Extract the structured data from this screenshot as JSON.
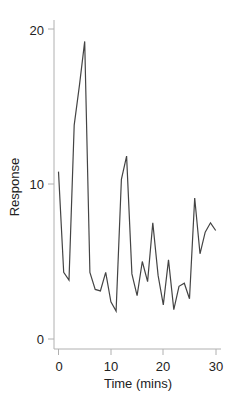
{
  "chart_data": {
    "type": "line",
    "title": "",
    "xlabel": "Time (mins)",
    "ylabel": "Response",
    "xlim": [
      -1,
      31
    ],
    "ylim": [
      -0.6,
      20.6
    ],
    "x_ticks": [
      0,
      10,
      20,
      30
    ],
    "y_ticks": [
      0,
      10,
      20
    ],
    "grid": false,
    "legend": null,
    "series": [
      {
        "name": "Response",
        "color": "#444444",
        "x": [
          0,
          1,
          2,
          3,
          4,
          5,
          6,
          7,
          8,
          9,
          10,
          11,
          12,
          13,
          14,
          15,
          16,
          17,
          18,
          19,
          20,
          21,
          22,
          23,
          24,
          25,
          26,
          27,
          28,
          29,
          30
        ],
        "values": [
          10.8,
          4.3,
          3.8,
          13.8,
          16.4,
          19.2,
          4.3,
          3.2,
          3.1,
          4.3,
          2.4,
          1.8,
          10.3,
          11.8,
          4.2,
          2.8,
          5.0,
          3.7,
          7.5,
          4.1,
          2.2,
          5.1,
          1.9,
          3.4,
          3.6,
          2.6,
          9.1,
          5.5,
          6.9,
          7.5,
          7.0
        ]
      }
    ]
  },
  "labels": {
    "x_ticks": [
      "0",
      "10",
      "20",
      "30"
    ],
    "y_ticks": [
      "0",
      "10",
      "20"
    ],
    "xlabel": "Time (mins)",
    "ylabel": "Response"
  }
}
